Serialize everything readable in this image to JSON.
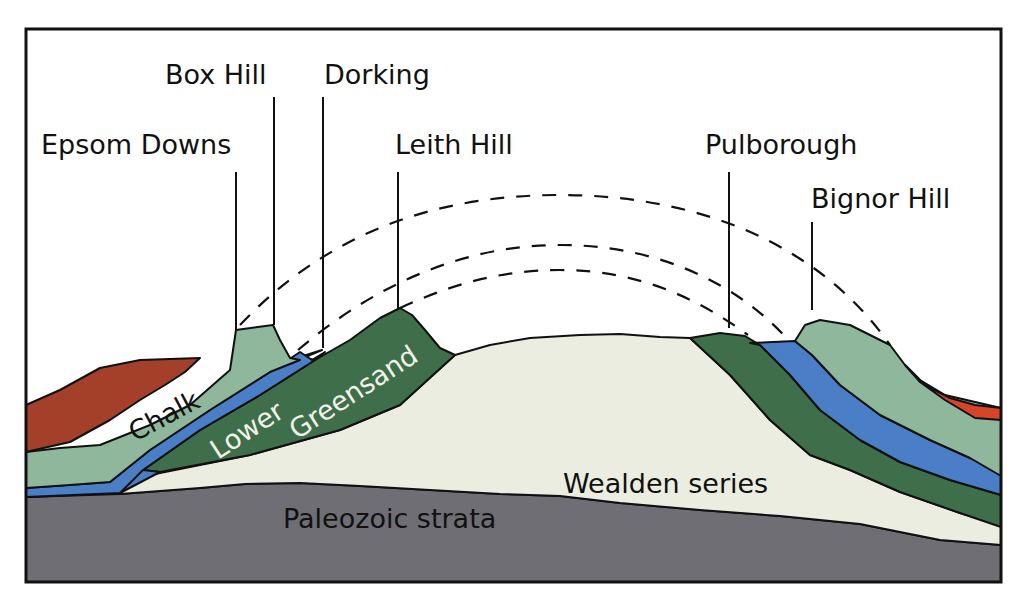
{
  "diagram": {
    "type": "geological cross-section",
    "locations": [
      {
        "id": "epsom-downs",
        "label": "Epsom Downs"
      },
      {
        "id": "box-hill",
        "label": "Box Hill"
      },
      {
        "id": "dorking",
        "label": "Dorking"
      },
      {
        "id": "leith-hill",
        "label": "Leith Hill"
      },
      {
        "id": "pulborough",
        "label": "Pulborough"
      },
      {
        "id": "bignor-hill",
        "label": "Bignor Hill"
      }
    ],
    "strata": [
      {
        "id": "chalk",
        "label": "Chalk",
        "color": "#8fb79c"
      },
      {
        "id": "lower",
        "label": "Lower",
        "color": "#3f6f4a"
      },
      {
        "id": "greensand",
        "label": "Greensand",
        "color": "#3f6f4a"
      },
      {
        "id": "wealden",
        "label": "Wealden series",
        "color": "#ecede1"
      },
      {
        "id": "paleozoic",
        "label": "Paleozoic strata",
        "color": "#6e6e74"
      }
    ],
    "colors": {
      "tertiary_left": "#a4402a",
      "tertiary_right": "#d8442a",
      "gault_blue": "#4a7fc8",
      "chalk": "#8fb79c",
      "greensand": "#3f6f4a",
      "wealden": "#ecede1",
      "paleozoic": "#6e6e74",
      "frame": "#111111"
    }
  }
}
